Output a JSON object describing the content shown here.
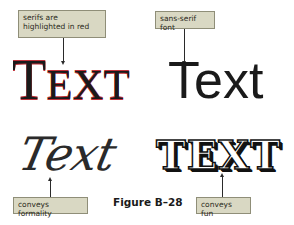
{
  "callouts": {
    "serif": "serifs are highlighted in red",
    "sans": "sans-serif font",
    "script": "conveys formality",
    "fun": "conveys fun"
  },
  "samples": {
    "serif_first": "T",
    "serif_rest": "EXT",
    "sans": "Text",
    "script": "Text",
    "fun": "TEXT"
  },
  "figure_label": "Figure B–28",
  "colors": {
    "callout_bg": "#d9d8c3",
    "serif_highlight": "#c0323a",
    "text": "#1a1a1a"
  }
}
